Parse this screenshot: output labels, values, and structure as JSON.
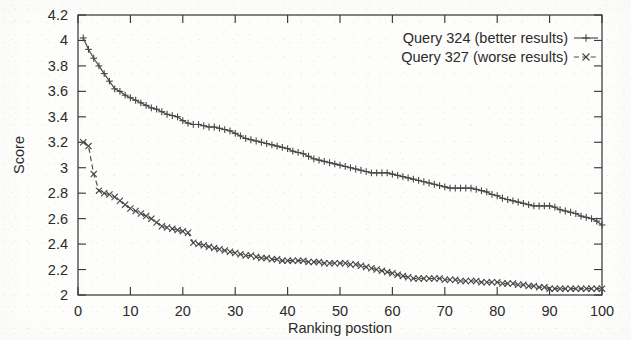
{
  "chart_data": {
    "type": "line",
    "title": "",
    "xlabel": "Ranking postion",
    "ylabel": "Score",
    "xlim": [
      0,
      100
    ],
    "ylim": [
      2,
      4.2
    ],
    "xticks": [
      0,
      10,
      20,
      30,
      40,
      50,
      60,
      70,
      80,
      90,
      100
    ],
    "xtick_labels": [
      "0",
      "10",
      "20",
      "30",
      "40",
      "50",
      "60",
      "70",
      "80",
      "90",
      "100"
    ],
    "yticks": [
      2,
      2.2,
      2.4,
      2.6,
      2.8,
      3,
      3.2,
      3.4,
      3.6,
      3.8,
      4,
      4.2
    ],
    "ytick_labels": [
      "2",
      "2.2",
      "2.4",
      "2.6",
      "2.8",
      "3",
      "3.2",
      "3.4",
      "3.6",
      "3.8",
      "4",
      "4.2"
    ],
    "grid": false,
    "legend_position": "top-right-inside",
    "x": [
      1,
      2,
      3,
      4,
      5,
      6,
      7,
      8,
      9,
      10,
      11,
      12,
      13,
      14,
      15,
      16,
      17,
      18,
      19,
      20,
      21,
      22,
      23,
      24,
      25,
      26,
      27,
      28,
      29,
      30,
      31,
      32,
      33,
      34,
      35,
      36,
      37,
      38,
      39,
      40,
      41,
      42,
      43,
      44,
      45,
      46,
      47,
      48,
      49,
      50,
      51,
      52,
      53,
      54,
      55,
      56,
      57,
      58,
      59,
      60,
      61,
      62,
      63,
      64,
      65,
      66,
      67,
      68,
      69,
      70,
      71,
      72,
      73,
      74,
      75,
      76,
      77,
      78,
      79,
      80,
      81,
      82,
      83,
      84,
      85,
      86,
      87,
      88,
      89,
      90,
      91,
      92,
      93,
      94,
      95,
      96,
      97,
      98,
      99,
      100
    ],
    "series": [
      {
        "name": "Query 324 (better results)",
        "marker": "plus",
        "linestyle": "solid",
        "color": "#4a4a4a",
        "values": [
          4.02,
          3.93,
          3.86,
          3.8,
          3.74,
          3.68,
          3.62,
          3.6,
          3.57,
          3.55,
          3.53,
          3.51,
          3.49,
          3.47,
          3.46,
          3.44,
          3.42,
          3.41,
          3.4,
          3.37,
          3.35,
          3.34,
          3.34,
          3.33,
          3.32,
          3.32,
          3.31,
          3.3,
          3.29,
          3.27,
          3.25,
          3.23,
          3.22,
          3.21,
          3.2,
          3.19,
          3.18,
          3.17,
          3.16,
          3.15,
          3.13,
          3.12,
          3.11,
          3.09,
          3.07,
          3.06,
          3.05,
          3.04,
          3.03,
          3.02,
          3.01,
          3.0,
          2.99,
          2.98,
          2.97,
          2.96,
          2.96,
          2.96,
          2.96,
          2.95,
          2.94,
          2.93,
          2.92,
          2.91,
          2.9,
          2.89,
          2.88,
          2.87,
          2.86,
          2.85,
          2.84,
          2.84,
          2.84,
          2.84,
          2.84,
          2.83,
          2.82,
          2.81,
          2.79,
          2.78,
          2.76,
          2.75,
          2.74,
          2.73,
          2.72,
          2.71,
          2.7,
          2.7,
          2.7,
          2.7,
          2.69,
          2.67,
          2.66,
          2.65,
          2.64,
          2.62,
          2.61,
          2.6,
          2.58,
          2.55
        ]
      },
      {
        "name": "Query 327 (worse results)",
        "marker": "x",
        "linestyle": "dashed",
        "color": "#4a4a4a",
        "values": [
          3.2,
          3.17,
          2.95,
          2.82,
          2.8,
          2.79,
          2.77,
          2.74,
          2.71,
          2.68,
          2.66,
          2.64,
          2.62,
          2.6,
          2.57,
          2.54,
          2.53,
          2.52,
          2.51,
          2.5,
          2.49,
          2.41,
          2.4,
          2.39,
          2.38,
          2.37,
          2.36,
          2.35,
          2.34,
          2.33,
          2.32,
          2.31,
          2.31,
          2.3,
          2.29,
          2.29,
          2.28,
          2.28,
          2.27,
          2.27,
          2.27,
          2.27,
          2.27,
          2.26,
          2.26,
          2.26,
          2.25,
          2.25,
          2.25,
          2.25,
          2.25,
          2.24,
          2.24,
          2.23,
          2.22,
          2.21,
          2.2,
          2.19,
          2.18,
          2.17,
          2.16,
          2.15,
          2.14,
          2.13,
          2.13,
          2.13,
          2.13,
          2.13,
          2.13,
          2.12,
          2.12,
          2.12,
          2.11,
          2.11,
          2.11,
          2.11,
          2.1,
          2.1,
          2.1,
          2.1,
          2.09,
          2.09,
          2.09,
          2.08,
          2.08,
          2.07,
          2.07,
          2.06,
          2.06,
          2.05,
          2.05,
          2.05,
          2.05,
          2.05,
          2.05,
          2.05,
          2.05,
          2.05,
          2.05,
          2.05
        ]
      }
    ]
  },
  "legend": {
    "entries": [
      {
        "label": "Query 324 (better results)",
        "sample": "solid-plus"
      },
      {
        "label": "Query 327 (worse results)",
        "sample": "dashed-x"
      }
    ]
  },
  "axes": {
    "y_title": "Score",
    "x_title": "Ranking postion"
  }
}
